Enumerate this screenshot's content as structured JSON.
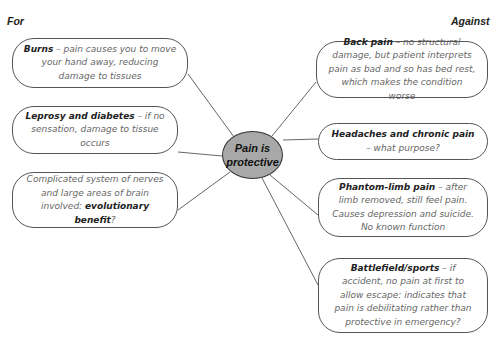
{
  "labels": {
    "for": "For",
    "against": "Against"
  },
  "center": {
    "line1": "Pain is",
    "line2": "protective",
    "fill": "#a8a8a8"
  },
  "for_nodes": [
    {
      "title": "Burns",
      "text": " – pain causes you to move your hand away, reducing damage to tissues"
    },
    {
      "title": "Leprosy and diabetes",
      "text": " – if no sensation, damage to tissue occurs"
    },
    {
      "pre": "Complicated system of nerves and large areas of brain involved: ",
      "title": "evolutionary benefit",
      "text": "?"
    }
  ],
  "against_nodes": [
    {
      "title": "Back pain",
      "text": " – no structural damage, but patient interprets pain as bad and so has bed rest, which makes the condition worse"
    },
    {
      "title": "Headaches and chronic pain",
      "text": " – what purpose?"
    },
    {
      "title": "Phantom-limb pain",
      "text": " – after limb removed, still feel pain. Causes depression and suicide. No known function"
    },
    {
      "title": "Battlefield/sports",
      "text": " – if accident, no pain at first to allow escape: indicates that pain is debilitating rather than protective in emergency?"
    }
  ]
}
